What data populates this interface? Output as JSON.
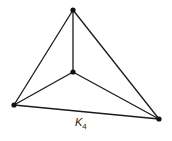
{
  "diagram": {
    "type": "graph",
    "name": "Complete graph K4",
    "label": {
      "main": "K",
      "subscript": "4"
    },
    "colors": {
      "edge": "#1a1a1a",
      "vertex": "#111111",
      "background": "#ffffff"
    },
    "vertices": [
      {
        "id": "top",
        "x": 73,
        "y": 10
      },
      {
        "id": "center",
        "x": 73,
        "y": 72
      },
      {
        "id": "left",
        "x": 14,
        "y": 105
      },
      {
        "id": "right",
        "x": 159,
        "y": 119
      }
    ],
    "edges": [
      [
        "top",
        "center"
      ],
      [
        "top",
        "left"
      ],
      [
        "top",
        "right"
      ],
      [
        "center",
        "left"
      ],
      [
        "center",
        "right"
      ],
      [
        "left",
        "right"
      ]
    ]
  }
}
